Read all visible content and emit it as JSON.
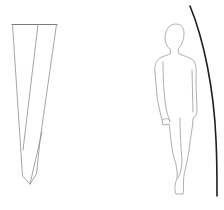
{
  "scene": {
    "background": "#ffffff",
    "elements": [
      {
        "name": "twisted-column",
        "description": "tapering twisted column line drawing",
        "stroke": "#8e8e8e"
      },
      {
        "name": "human-figure",
        "description": "standing human silhouette outline",
        "stroke": "#9a9a9a"
      },
      {
        "name": "curved-arc",
        "description": "thick dark curved arc at right edge",
        "stroke": "#1e1e1e"
      }
    ]
  }
}
